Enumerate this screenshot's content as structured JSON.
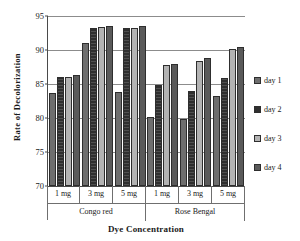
{
  "chart_data": {
    "type": "bar",
    "title": "",
    "xlabel": "Dye Concentration",
    "ylabel": "Rate  of  Decolorization",
    "ylim": [
      70,
      95
    ],
    "yticks": [
      70,
      75,
      80,
      85,
      90,
      95
    ],
    "grid": true,
    "legend_position": "right",
    "group_labels": [
      "Congo red",
      "Rose Bengal"
    ],
    "categories": [
      "1 mg",
      "3 mg",
      "5 mg",
      "1 mg",
      "3 mg",
      "5 mg"
    ],
    "series": [
      {
        "name": "day 1",
        "color": "#6e6e6e",
        "values": [
          83.7,
          91.1,
          83.8,
          80.1,
          79.9,
          83.2
        ]
      },
      {
        "name": "day 2",
        "color": "#2f2f2f",
        "values": [
          86.0,
          93.3,
          93.2,
          84.9,
          84.0,
          85.9
        ]
      },
      {
        "name": "day 3",
        "color": "#b3b3b3",
        "values": [
          86.0,
          93.4,
          93.3,
          87.8,
          88.4,
          90.1
        ]
      },
      {
        "name": "day 4",
        "color": "#5a5a5a",
        "values": [
          86.3,
          93.5,
          93.5,
          88.0,
          88.8,
          90.4
        ]
      }
    ]
  }
}
